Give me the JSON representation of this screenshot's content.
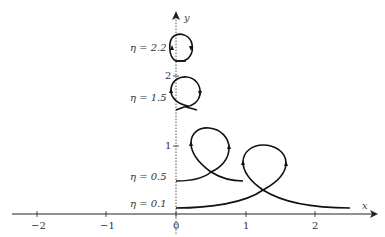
{
  "figure": {
    "axes": {
      "x_label": "x",
      "y_label": "y",
      "x_ticks": [
        "−2",
        "−1",
        "0",
        "1",
        "2"
      ],
      "y_ticks": [
        "1",
        "2"
      ]
    },
    "curves": [
      {
        "label": "η = 2.2",
        "eta": 2.2,
        "shape": "closed loop"
      },
      {
        "label": "η = 1.5",
        "eta": 1.5,
        "shape": "loop with small crossing"
      },
      {
        "label": "η = 0.5",
        "eta": 0.5,
        "shape": "curve with loop"
      },
      {
        "label": "η = 0.1",
        "eta": 0.1,
        "shape": "curve with loop"
      }
    ],
    "colors": {
      "curve": "#111111",
      "axis": "#222222",
      "dotted_axis": "#555555"
    }
  }
}
